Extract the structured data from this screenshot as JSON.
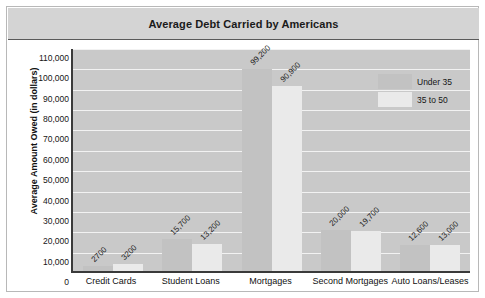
{
  "chart_data": {
    "type": "bar",
    "title": "Average Debt Carried by Americans",
    "xlabel": "",
    "ylabel": "Average Amount Owed (in dollars)",
    "ylim": [
      0,
      110000
    ],
    "ytick_step": 10000,
    "yticks": [
      "0",
      "10,000",
      "20,000",
      "30,000",
      "40,000",
      "50,000",
      "60,000",
      "70,000",
      "80,000",
      "90,000",
      "100,000",
      "110,000"
    ],
    "categories": [
      "Credit Cards",
      "Student Loans",
      "Mortgages",
      "Second Mortgages",
      "Auto Loans/Leases"
    ],
    "series": [
      {
        "name": "Under 35",
        "color": "#c2c2c2",
        "values": [
          2700,
          15700,
          99200,
          20000,
          12600
        ],
        "labels": [
          "2700",
          "15,700",
          "99,200",
          "20,000",
          "12,600"
        ]
      },
      {
        "name": "35 to 50",
        "color": "#eaeaea",
        "values": [
          3200,
          13200,
          90900,
          19700,
          13000
        ],
        "labels": [
          "3200",
          "13,200",
          "90,900",
          "19,700",
          "13,000"
        ]
      }
    ],
    "grid": true,
    "legend_position": "top-right",
    "plot_background": "#c9c9c9",
    "gridline_color": "#f2f2f2"
  },
  "legend": {
    "items": [
      {
        "label": "Under 35"
      },
      {
        "label": "35 to 50"
      }
    ]
  }
}
